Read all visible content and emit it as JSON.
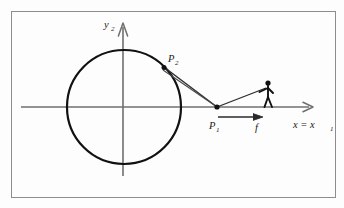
{
  "figure": {
    "kind": "geometry-diagram",
    "background_color": "#fdfdfd",
    "frame": {
      "name": "figure-border",
      "stroke_color": "#8d8d8d",
      "x": 11,
      "y": 11,
      "width": 325,
      "height": 187
    },
    "axes": {
      "stroke_color": "#6f6f6f",
      "origin": {
        "x": 123,
        "y": 107
      },
      "x_axis": {
        "label": "x = x",
        "label_sub": "1",
        "label_full": "x = x₁",
        "from_x": 21,
        "to_x": 313,
        "y": 107
      },
      "y_axis": {
        "label": "y",
        "label_sub": "2",
        "label_full": "y₂",
        "x": 123,
        "from_y": 176,
        "to_y": 23
      }
    },
    "circle": {
      "name": "circle-path",
      "stroke_color": "#111111",
      "center_x": 124,
      "center_y": 107,
      "radius": 57
    },
    "points": [
      {
        "id": "P2",
        "label": "P",
        "label_sub": "2",
        "label_full": "P₂",
        "x": 164,
        "y": 67,
        "label_x": 168,
        "label_y": 58
      },
      {
        "id": "P1",
        "label": "P",
        "label_sub": "1",
        "label_full": "P₁",
        "x": 217,
        "y": 107,
        "label_x": 211,
        "label_y": 125
      }
    ],
    "connector": {
      "name": "p2-p1-wedge",
      "description": "narrow double-line wedge from P2 to P1",
      "stroke_color": "#333333"
    },
    "force_arrow": {
      "name": "force-arrow-f",
      "label": "f",
      "from_x": 218,
      "to_x": 263,
      "y": 117,
      "stroke_color": "#2a2a2a",
      "label_x": 258,
      "label_y": 130
    },
    "person": {
      "name": "stick-figure-person",
      "stroke_color": "#111111",
      "head_x": 268,
      "head_y": 83,
      "feet_y": 107,
      "description": "stick figure standing on the x-axis pulling the rope to P1"
    }
  }
}
